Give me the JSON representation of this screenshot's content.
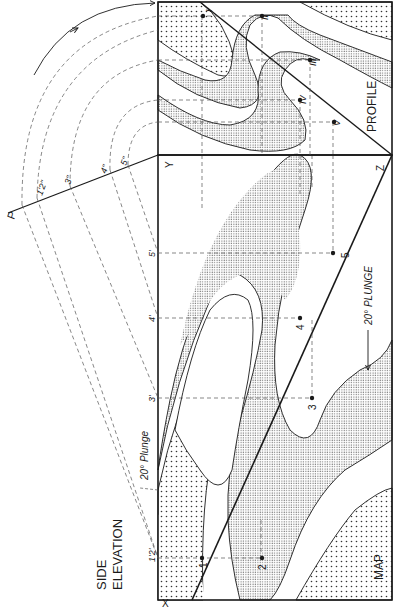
{
  "figure": {
    "orientation": "rotated 90 degrees counter-clockwise",
    "colors": {
      "ink": "#1a1a1a",
      "coarse_stipple": "#d9d9d9",
      "fine_stipple": "#bdbdbd",
      "paper": "#ffffff"
    }
  },
  "panels": {
    "map": {
      "label": "MAP"
    },
    "profile": {
      "label": "PROFILE"
    },
    "side_elevation": {
      "label_line1": "SIDE",
      "label_line2": "ELEVATION"
    }
  },
  "corners": {
    "x": "X",
    "y": "Y",
    "z": "Z",
    "p": "P"
  },
  "plunge": {
    "map_arrow_label": "20° PLUNGE",
    "elevation_label": "20° Plunge"
  },
  "map_points": [
    "1",
    "2",
    "3",
    "4",
    "5"
  ],
  "elevation_points": [
    "1'2'",
    "3'",
    "4'",
    "5'"
  ],
  "arc_points": [
    "1'2\"",
    "3\"",
    "4\"",
    "5\""
  ],
  "profile_points": [
    "I",
    "II",
    "III",
    "IV",
    "V"
  ]
}
